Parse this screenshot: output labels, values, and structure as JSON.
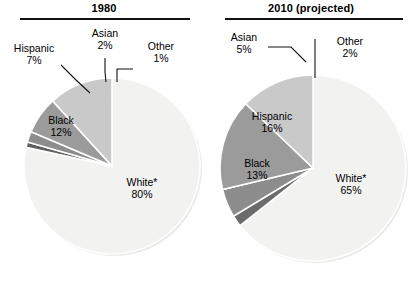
{
  "figure": {
    "kind": "two-pie-comparison",
    "note_symbol": "*"
  },
  "chart_data": [
    {
      "type": "pie",
      "title": "1980",
      "xlabel": "",
      "ylabel": "",
      "legend_position": "none",
      "categories": [
        "White*",
        "Other",
        "Asian",
        "Hispanic",
        "Black"
      ],
      "values": [
        80,
        1,
        2,
        7,
        12
      ],
      "labels": [
        {
          "name": "White*",
          "value": "80%",
          "placement": "inside"
        },
        {
          "name": "Other",
          "value": "1%",
          "placement": "outside"
        },
        {
          "name": "Asian",
          "value": "2%",
          "placement": "outside"
        },
        {
          "name": "Hispanic",
          "value": "7%",
          "placement": "outside"
        },
        {
          "name": "Black",
          "value": "12%",
          "placement": "inside"
        }
      ],
      "colors": [
        "#f2f2f0",
        "#5e5e5e",
        "#8d8d8d",
        "#9b9b9b",
        "#c9c9c9"
      ]
    },
    {
      "type": "pie",
      "title": "2010 (projected)",
      "xlabel": "",
      "ylabel": "",
      "legend_position": "none",
      "categories": [
        "White*",
        "Other",
        "Asian",
        "Hispanic",
        "Black"
      ],
      "values": [
        65,
        2,
        5,
        16,
        13
      ],
      "labels": [
        {
          "name": "White*",
          "value": "65%",
          "placement": "inside"
        },
        {
          "name": "Other",
          "value": "2%",
          "placement": "outside"
        },
        {
          "name": "Asian",
          "value": "5%",
          "placement": "outside"
        },
        {
          "name": "Hispanic",
          "value": "16%",
          "placement": "inside"
        },
        {
          "name": "Black",
          "value": "13%",
          "placement": "inside"
        }
      ],
      "colors": [
        "#f2f2f0",
        "#6b6b6b",
        "#8d8d8d",
        "#9b9b9b",
        "#c9c9c9"
      ]
    }
  ],
  "chart_1980": {
    "title": "1980",
    "white_name": "White*",
    "white_value": "80%",
    "black_name": "Black",
    "black_value": "12%",
    "hispanic_name": "Hispanic",
    "hispanic_value": "7%",
    "asian_name": "Asian",
    "asian_value": "2%",
    "other_name": "Other",
    "other_value": "1%"
  },
  "chart_2010": {
    "title": "2010 (projected)",
    "white_name": "White*",
    "white_value": "65%",
    "black_name": "Black",
    "black_value": "13%",
    "hispanic_name": "Hispanic",
    "hispanic_value": "16%",
    "asian_name": "Asian",
    "asian_value": "5%",
    "other_name": "Other",
    "other_value": "2%"
  }
}
